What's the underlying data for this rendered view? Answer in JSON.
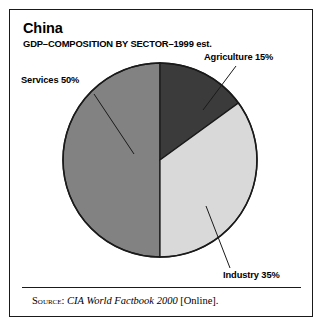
{
  "figure": {
    "title": "China",
    "subtitle": "GDP–COMPOSITION BY SECTOR–1999 est.",
    "source": {
      "label": "Source:",
      "work": "CIA World Factbook 2000",
      "suffix": "[Online]."
    }
  },
  "chart_data": {
    "type": "pie",
    "title": "China",
    "subtitle": "GDP–COMPOSITION BY SECTOR–1999 est.",
    "categories": [
      "Agriculture",
      "Industry",
      "Services"
    ],
    "values": [
      15,
      35,
      50
    ],
    "unit": "%",
    "start_angle_deg": 0,
    "direction": "clockwise",
    "legend": "none",
    "grid": false,
    "labels": [
      {
        "name": "agriculture",
        "text": "Agriculture 15%",
        "value": 15,
        "color": "#3b3b3b"
      },
      {
        "name": "industry",
        "text": "Industry 35%",
        "value": 35,
        "color": "#d9d9d9"
      },
      {
        "name": "services",
        "text": "Services 50%",
        "value": 50,
        "color": "#828282"
      }
    ],
    "colors": {
      "agriculture": "#3b3b3b",
      "industry": "#d9d9d9",
      "services": "#828282",
      "outline": "#1a1a1a",
      "background": "#ffffff"
    }
  }
}
